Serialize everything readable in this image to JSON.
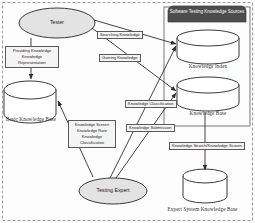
{
  "diagram": {
    "title_bar": {
      "label": "Software Testing Knowledge Sources",
      "fill": "#4d4d4d",
      "text_color": "#ffffff"
    },
    "actors": [
      {
        "id": "tester",
        "label": "Tester",
        "shape": "ellipse",
        "fill": "#e3e3e3"
      },
      {
        "id": "testing-expert",
        "label": "Testing Expert",
        "shape": "ellipse",
        "fill": "#e3e3e3"
      }
    ],
    "datastores": [
      {
        "id": "basic-knowledge-base",
        "label": "Basic Knowledge Base",
        "shape": "cylinder"
      },
      {
        "id": "knowledge-index",
        "label": "Knowledge Index",
        "shape": "cylinder"
      },
      {
        "id": "knowledge-base",
        "label": "Knowledge Base",
        "shape": "cylinder"
      },
      {
        "id": "expert-system-knowledge-base",
        "label": "Expert System Knowledge Base",
        "shape": "cylinder"
      }
    ],
    "edge_labels": [
      {
        "id": "providing-knowledge",
        "lines": [
          "Providing Knowledge",
          "Knowledge Representation"
        ]
      },
      {
        "id": "searching-knowledge",
        "lines": [
          "Searching Knowledge"
        ]
      },
      {
        "id": "gaining-knowledge",
        "lines": [
          "Gaining Knowledge"
        ]
      },
      {
        "id": "knowledge-classification",
        "lines": [
          "Knowledge Classification"
        ]
      },
      {
        "id": "knowledge-submission",
        "lines": [
          "Knowledge Submission"
        ]
      },
      {
        "id": "knowledge-screen-rate-classification",
        "lines": [
          "Knowledge Screen",
          "Knowledge Rate",
          "Knowledge Classification"
        ]
      },
      {
        "id": "knowledge-search-screen",
        "lines": [
          "Knowledge Search/Knowledge Screen"
        ]
      }
    ],
    "colors": {
      "stroke": "#3a3a3a",
      "shape_fill": "#ffffff",
      "actor_fill": "#e3e3e3",
      "label_fill": "#f4f4f4",
      "header_fill": "#4d4d4d",
      "border": "#9a9a9a"
    }
  }
}
